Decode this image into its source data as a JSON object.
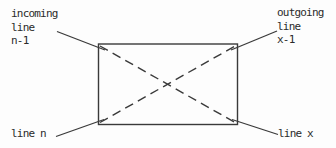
{
  "diagram": {
    "background": "#fdfdfd",
    "line_color": "#3a3a3a",
    "box": {
      "description": "switch-matrix-box"
    },
    "labels": {
      "top_left": [
        "incoming",
        "line",
        "n-1"
      ],
      "top_right": [
        "outgoing",
        "line",
        "x-1"
      ],
      "bottom_left": "line n",
      "bottom_right": "line x"
    }
  }
}
